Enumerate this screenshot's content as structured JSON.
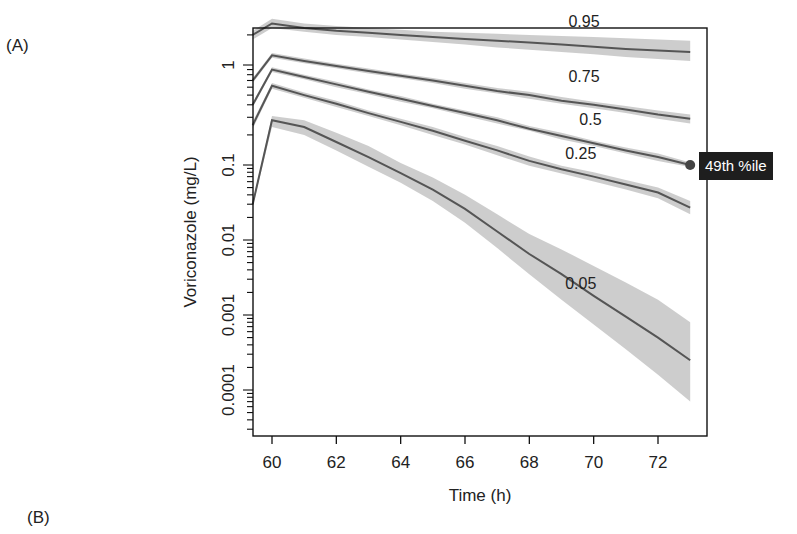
{
  "panels": {
    "a_label": "(A)",
    "b_label": "(B)"
  },
  "tooltip": {
    "text": "49th %ile",
    "background": "#1e1e1e"
  },
  "colors": {
    "line": "#555555",
    "band": "#c8c8c8",
    "axis": "#111111",
    "marker": "#444444"
  },
  "chart_data": {
    "type": "line",
    "title": "",
    "xlabel": "Time (h)",
    "ylabel": "Voriconazole (mg/L)",
    "xscale": "linear",
    "yscale": "log",
    "xlim": [
      59.4,
      73.5
    ],
    "ylim": [
      2e-05,
      4
    ],
    "xticks": [
      60,
      62,
      64,
      66,
      68,
      70,
      72
    ],
    "yticks": [
      1,
      0.1,
      0.01,
      0.001,
      0.0001
    ],
    "ytick_labels": [
      "1",
      "0.1",
      "0.01",
      "0.001",
      "0.0001"
    ],
    "x": [
      59.4,
      60,
      61,
      62,
      63,
      64,
      65,
      66,
      67,
      68,
      69,
      70,
      71,
      72,
      73
    ],
    "series": [
      {
        "name": "0.95",
        "label_pos": [
          69.7,
          2.4
        ],
        "values": [
          2.0,
          2.6,
          2.35,
          2.2,
          2.1,
          2.0,
          1.9,
          1.82,
          1.75,
          1.68,
          1.6,
          1.52,
          1.45,
          1.4,
          1.35
        ],
        "lower": [
          1.8,
          2.35,
          2.15,
          2.0,
          1.9,
          1.8,
          1.7,
          1.6,
          1.5,
          1.42,
          1.35,
          1.28,
          1.2,
          1.15,
          1.1
        ],
        "upper": [
          2.2,
          2.9,
          2.6,
          2.45,
          2.35,
          2.25,
          2.15,
          2.1,
          2.05,
          2.0,
          1.95,
          1.9,
          1.85,
          1.8,
          1.75
        ]
      },
      {
        "name": "0.75",
        "label_pos": [
          69.7,
          0.68
        ],
        "values": [
          0.7,
          1.25,
          1.1,
          0.98,
          0.87,
          0.78,
          0.7,
          0.62,
          0.55,
          0.5,
          0.44,
          0.4,
          0.36,
          0.32,
          0.29
        ],
        "lower": [
          0.66,
          1.18,
          1.04,
          0.93,
          0.82,
          0.74,
          0.66,
          0.58,
          0.52,
          0.46,
          0.41,
          0.37,
          0.33,
          0.29,
          0.26
        ],
        "upper": [
          0.74,
          1.32,
          1.16,
          1.03,
          0.92,
          0.82,
          0.74,
          0.66,
          0.59,
          0.54,
          0.48,
          0.43,
          0.39,
          0.35,
          0.32
        ]
      },
      {
        "name": "0.5",
        "label_pos": [
          69.9,
          0.25
        ],
        "values": [
          0.4,
          0.9,
          0.76,
          0.64,
          0.54,
          0.46,
          0.39,
          0.33,
          0.28,
          0.23,
          0.195,
          0.165,
          0.14,
          0.12,
          0.1
        ],
        "lower": [
          0.38,
          0.85,
          0.72,
          0.6,
          0.51,
          0.43,
          0.37,
          0.31,
          0.26,
          0.22,
          0.18,
          0.155,
          0.13,
          0.11,
          0.094
        ],
        "upper": [
          0.42,
          0.95,
          0.8,
          0.68,
          0.57,
          0.49,
          0.41,
          0.35,
          0.3,
          0.245,
          0.21,
          0.175,
          0.15,
          0.13,
          0.106
        ]
      },
      {
        "name": "0.25",
        "label_pos": [
          69.6,
          0.115
        ],
        "values": [
          0.25,
          0.62,
          0.5,
          0.41,
          0.33,
          0.27,
          0.22,
          0.175,
          0.14,
          0.11,
          0.088,
          0.07,
          0.055,
          0.043,
          0.027
        ],
        "lower": [
          0.23,
          0.58,
          0.47,
          0.38,
          0.31,
          0.25,
          0.2,
          0.16,
          0.125,
          0.098,
          0.077,
          0.06,
          0.047,
          0.036,
          0.022
        ],
        "upper": [
          0.27,
          0.66,
          0.53,
          0.44,
          0.35,
          0.29,
          0.24,
          0.19,
          0.155,
          0.122,
          0.098,
          0.08,
          0.063,
          0.05,
          0.033
        ]
      },
      {
        "name": "0.05",
        "label_pos": [
          69.6,
          0.0022
        ],
        "values": [
          0.03,
          0.28,
          0.24,
          0.17,
          0.12,
          0.078,
          0.047,
          0.026,
          0.013,
          0.0065,
          0.0035,
          0.0018,
          0.00095,
          0.0005,
          0.00025
        ],
        "lower": [
          0.028,
          0.24,
          0.2,
          0.14,
          0.095,
          0.058,
          0.033,
          0.017,
          0.0078,
          0.0035,
          0.0016,
          0.00075,
          0.00035,
          0.00016,
          7e-05
        ],
        "upper": [
          0.032,
          0.31,
          0.28,
          0.21,
          0.155,
          0.105,
          0.068,
          0.04,
          0.022,
          0.012,
          0.0075,
          0.0045,
          0.0027,
          0.0016,
          0.0008
        ]
      }
    ],
    "annotation": {
      "text": "49th %ile",
      "x": 73,
      "y": 0.1
    },
    "grid": false,
    "legend": null
  }
}
